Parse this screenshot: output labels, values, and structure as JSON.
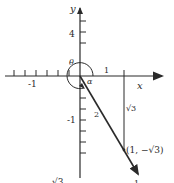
{
  "diagram": {
    "type": "coordinate-plane-vector",
    "axes": {
      "x_label": "x",
      "y_label": "y",
      "x_tick_labels": [
        "-1",
        "1"
      ],
      "y_tick_labels": [
        "4",
        "-1"
      ]
    },
    "angles": {
      "theta_label": "θ",
      "alpha_label": "α"
    },
    "vector": {
      "length_label": "2",
      "vertical_leg_label": "√3",
      "point_label": "(1, −√3)"
    },
    "bottom_fragments": {
      "left": "√3",
      "right": "1"
    },
    "colors": {
      "ink": "#2a2a2a",
      "background": "#ffffff"
    }
  }
}
